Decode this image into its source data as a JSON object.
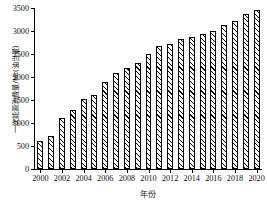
{
  "chart_data": {
    "type": "bar",
    "title": "",
    "xlabel": "年份",
    "ylabel": "一次能源消费量/Mt(油当量)",
    "categories": [
      "2000",
      "2001",
      "2002",
      "2003",
      "2004",
      "2005",
      "2006",
      "2007",
      "2008",
      "2009",
      "2010",
      "2011",
      "2012",
      "2013",
      "2014",
      "2015",
      "2016",
      "2017",
      "2018",
      "2019",
      "2020"
    ],
    "values": [
      600,
      720,
      1100,
      1280,
      1520,
      1600,
      1900,
      2090,
      2190,
      2300,
      2490,
      2680,
      2720,
      2820,
      2880,
      2930,
      3000,
      3120,
      3220,
      3370,
      3450
    ],
    "ylim": [
      0,
      3500
    ],
    "ytick_labels": [
      "0",
      "500",
      "1000",
      "1500",
      "2000",
      "2500",
      "3000",
      "3500"
    ],
    "ytick_values": [
      0,
      500,
      1000,
      1500,
      2000,
      2500,
      3000,
      3500
    ],
    "xtick_labels": [
      "2000",
      "2002",
      "2004",
      "2006",
      "2008",
      "2010",
      "2012",
      "2014",
      "2016",
      "2018",
      "2020"
    ],
    "xtick_categories": [
      "2000",
      "2002",
      "2004",
      "2006",
      "2008",
      "2010",
      "2012",
      "2014",
      "2016",
      "2018",
      "2020"
    ],
    "grid": false,
    "legend": null,
    "bar_fill": "#ffffff",
    "bar_edge": "#000000",
    "bar_hatch": "diagonal-45",
    "background": "#ffffff"
  }
}
